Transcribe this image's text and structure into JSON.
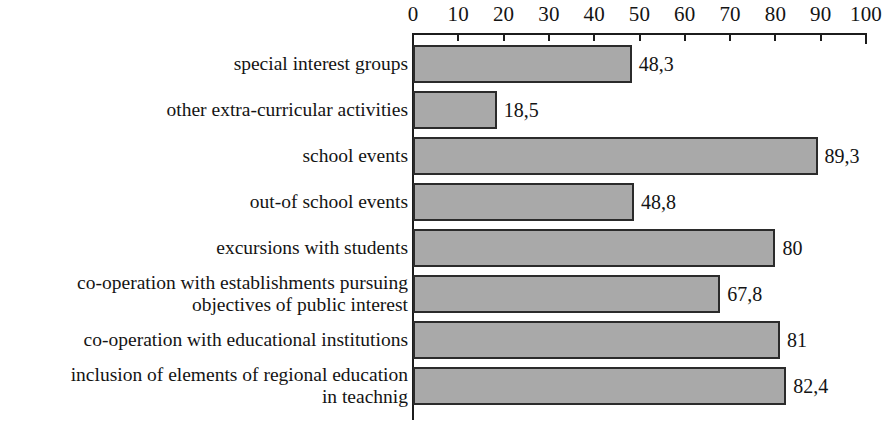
{
  "chart_data": {
    "type": "bar",
    "orientation": "horizontal",
    "title": "",
    "subtitle": "",
    "xlabel": "",
    "ylabel": "",
    "xlim": [
      0,
      100
    ],
    "grid": false,
    "legend": null,
    "axis": {
      "ticks": [
        0,
        10,
        20,
        30,
        40,
        50,
        60,
        70,
        80,
        90,
        100
      ],
      "tick_labels": [
        "0",
        "10",
        "20",
        "30",
        "40",
        "50",
        "60",
        "70",
        "80",
        "90",
        "100"
      ],
      "position": "top",
      "decimal_separator": ","
    },
    "categories": [
      "special interest groups",
      "other extra-curricular activities",
      "school events",
      "out-of school events",
      "excursions with students",
      "co-operation with establishments pursuing objectives of public interest",
      "co-operation with educational institutions",
      "inclusion of elements of regional education in teachnig"
    ],
    "values": [
      48.3,
      18.5,
      89.3,
      48.8,
      80,
      67.8,
      81,
      82.4
    ],
    "value_labels": [
      "48,3",
      "18,5",
      "89,3",
      "48,8",
      "80",
      "67,8",
      "81",
      "82,4"
    ],
    "bars": [
      {
        "label_lines": [
          "special interest groups"
        ],
        "value": 48.3,
        "value_label": "48,3"
      },
      {
        "label_lines": [
          "other extra-curricular activities"
        ],
        "value": 18.5,
        "value_label": "18,5"
      },
      {
        "label_lines": [
          "school events"
        ],
        "value": 89.3,
        "value_label": "89,3"
      },
      {
        "label_lines": [
          "out-of school events"
        ],
        "value": 48.8,
        "value_label": "48,8"
      },
      {
        "label_lines": [
          "excursions with students"
        ],
        "value": 80,
        "value_label": "80"
      },
      {
        "label_lines": [
          "co-operation with establishments pursuing",
          "objectives of public interest"
        ],
        "value": 67.8,
        "value_label": "67,8"
      },
      {
        "label_lines": [
          "co-operation with educational institutions"
        ],
        "value": 81,
        "value_label": "81"
      },
      {
        "label_lines": [
          "inclusion of elements of regional education",
          "in teachnig"
        ],
        "value": 82.4,
        "value_label": "82,4"
      }
    ],
    "colors": {
      "bar_fill": "#a9a9a9",
      "bar_border": "#2b2b2b",
      "axis": "#1c1c1c",
      "text": "#141414",
      "background": "#ffffff"
    }
  }
}
